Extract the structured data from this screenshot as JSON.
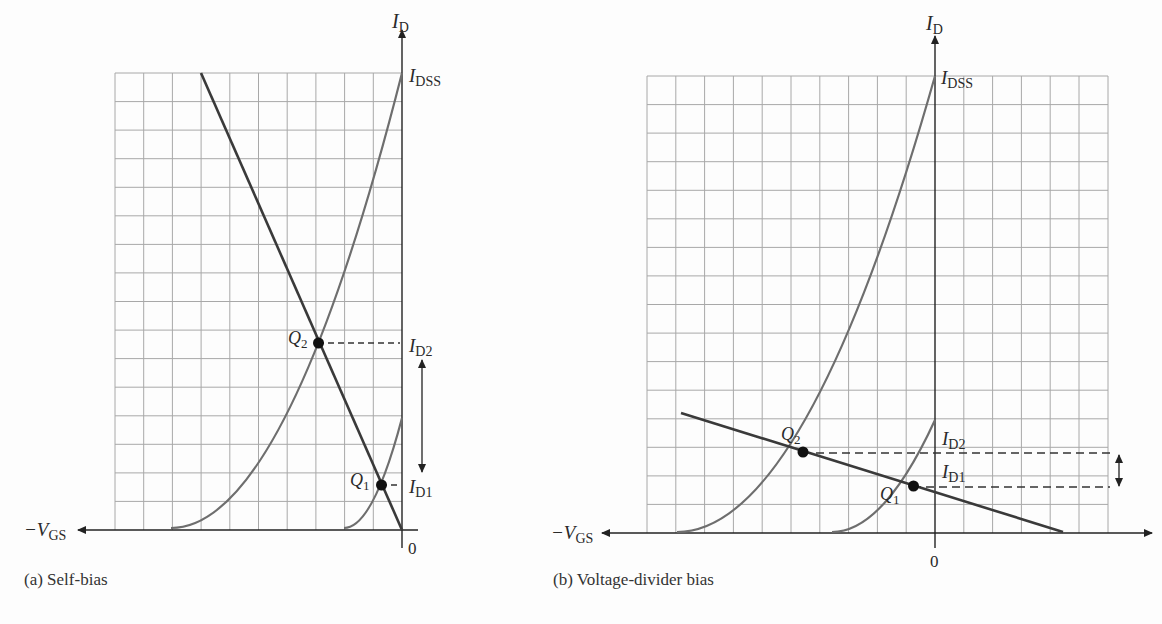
{
  "figure": {
    "panels": [
      {
        "id": "a",
        "caption": "(a) Self-bias",
        "y_axis_label": "I",
        "y_axis_sub": "D",
        "x_axis_label": "−V",
        "x_axis_sub": "GS",
        "origin_label": "0",
        "idss_label": "I",
        "idss_sub": "DSS",
        "q1_label": "Q",
        "q1_sub": "1",
        "q2_label": "Q",
        "q2_sub": "2",
        "id1_label": "I",
        "id1_sub": "D1",
        "id2_label": "I",
        "id2_sub": "D2"
      },
      {
        "id": "b",
        "caption": "(b) Voltage-divider bias",
        "y_axis_label": "I",
        "y_axis_sub": "D",
        "x_axis_label": "−V",
        "x_axis_sub": "GS",
        "origin_label": "0",
        "idss_label": "I",
        "idss_sub": "DSS",
        "q1_label": "Q",
        "q1_sub": "1",
        "q2_label": "Q",
        "q2_sub": "2",
        "id1_label": "I",
        "id1_sub": "D1",
        "id2_label": "I",
        "id2_sub": "D2"
      }
    ],
    "colors": {
      "grid": "#a8a8a8",
      "curve": "#6e6e6e",
      "load_line": "#3a3a3a",
      "axis": "#222222",
      "point": "#111111"
    }
  }
}
